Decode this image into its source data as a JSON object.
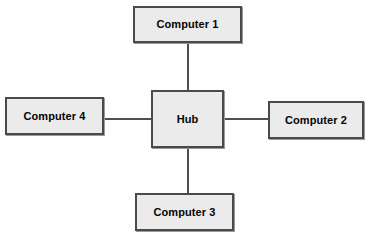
{
  "diagram": {
    "type": "star-topology-network-diagram",
    "background_color": "#fefefe",
    "node_fill_color": "#ebebeb",
    "node_border_color": "#4a4a4a",
    "link_color": "#4f4f4f",
    "text_color": "#050505",
    "nodes": [
      {
        "id": "computer-1",
        "label": "Computer 1",
        "role": "client",
        "position": "top"
      },
      {
        "id": "hub",
        "label": "Hub",
        "role": "hub",
        "position": "center"
      },
      {
        "id": "computer-2",
        "label": "Computer 2",
        "role": "client",
        "position": "right"
      },
      {
        "id": "computer-3",
        "label": "Computer 3",
        "role": "client",
        "position": "bottom"
      },
      {
        "id": "computer-4",
        "label": "Computer 4",
        "role": "client",
        "position": "left"
      }
    ],
    "links": [
      {
        "id": "hub-computer-1",
        "from": "hub",
        "to": "computer-1",
        "orientation": "vertical"
      },
      {
        "id": "hub-computer-2",
        "from": "hub",
        "to": "computer-2",
        "orientation": "horizontal"
      },
      {
        "id": "hub-computer-3",
        "from": "hub",
        "to": "computer-3",
        "orientation": "vertical"
      },
      {
        "id": "hub-computer-4",
        "from": "hub",
        "to": "computer-4",
        "orientation": "horizontal"
      }
    ]
  }
}
